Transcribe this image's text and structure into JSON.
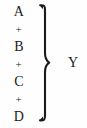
{
  "figure": {
    "type": "brace-grouping-equation",
    "background_color": "#fefefe",
    "ink_color": "#1a1a1a",
    "width": 87,
    "height": 128,
    "expression": "A + B + C + D = Y",
    "terms": [
      {
        "kind": "term",
        "label": "A"
      },
      {
        "kind": "operator",
        "label": "+"
      },
      {
        "kind": "term",
        "label": "B"
      },
      {
        "kind": "operator",
        "label": "+"
      },
      {
        "kind": "term",
        "label": "C"
      },
      {
        "kind": "operator",
        "label": "+"
      },
      {
        "kind": "term",
        "label": "D"
      }
    ],
    "brace": {
      "icon": "right-curly-brace-icon",
      "orientation": "points-right",
      "stroke_width": 2
    },
    "result": {
      "label": "Y"
    }
  }
}
